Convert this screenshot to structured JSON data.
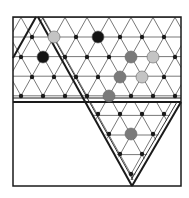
{
  "diagram": {
    "colors": {
      "line": "#555555",
      "border": "#1a1a1a",
      "dot": "#1a1a1a",
      "black_peg": "#141414",
      "dark_gray_peg": "#7a7a7a",
      "light_gray_peg": "#c4c4c4"
    },
    "pegs": [
      {
        "x": 54,
        "y": 37,
        "color": "light_gray_peg"
      },
      {
        "x": 98,
        "y": 37,
        "color": "black_peg"
      },
      {
        "x": 43,
        "y": 57,
        "color": "black_peg"
      },
      {
        "x": 131,
        "y": 57,
        "color": "dark_gray_peg"
      },
      {
        "x": 153,
        "y": 57,
        "color": "light_gray_peg"
      },
      {
        "x": 120,
        "y": 77,
        "color": "dark_gray_peg"
      },
      {
        "x": 142,
        "y": 77,
        "color": "light_gray_peg"
      },
      {
        "x": 109,
        "y": 96,
        "color": "dark_gray_peg"
      },
      {
        "x": 131,
        "y": 134,
        "color": "dark_gray_peg"
      }
    ],
    "dot_rows": [
      {
        "y": 37,
        "xs": [
          32,
          76,
          120,
          142,
          164
        ]
      },
      {
        "y": 57,
        "xs": [
          21,
          65,
          87,
          109,
          175
        ]
      },
      {
        "y": 77,
        "xs": [
          32,
          54,
          76,
          98,
          164
        ]
      },
      {
        "y": 96,
        "xs": [
          21,
          43,
          65,
          87,
          131,
          153,
          175
        ]
      },
      {
        "y": 114,
        "xs": [
          98,
          120,
          142,
          164
        ]
      },
      {
        "y": 134,
        "xs": [
          109,
          153
        ]
      },
      {
        "y": 154,
        "xs": [
          120,
          142
        ]
      },
      {
        "y": 174,
        "xs": [
          131
        ]
      }
    ]
  }
}
